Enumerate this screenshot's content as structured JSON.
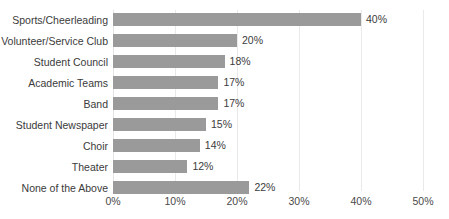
{
  "chart_data": {
    "type": "bar",
    "orientation": "horizontal",
    "title": "",
    "xlabel": "",
    "ylabel": "",
    "xlim": [
      0,
      50
    ],
    "grid": true,
    "legend": null,
    "bar_color": "#9a9a9a",
    "gridline_color": "#e9e9e9",
    "text_color": "#3b3b3b",
    "background": "#ffffff",
    "value_suffix": "%",
    "categories": [
      "Sports/Cheerleading",
      "Volunteer/Service Club",
      "Student Council",
      "Academic Teams",
      "Band",
      "Student Newspaper",
      "Choir",
      "Theater",
      "None of the Above"
    ],
    "values": [
      40,
      20,
      18,
      17,
      17,
      15,
      14,
      12,
      22
    ],
    "data_labels": [
      "40%",
      "20%",
      "18%",
      "17%",
      "17%",
      "15%",
      "14%",
      "12%",
      "22%"
    ],
    "xticks": [
      0,
      10,
      20,
      30,
      40,
      50
    ],
    "xtick_labels": [
      "0%",
      "10%",
      "20%",
      "30%",
      "40%",
      "50%"
    ]
  }
}
